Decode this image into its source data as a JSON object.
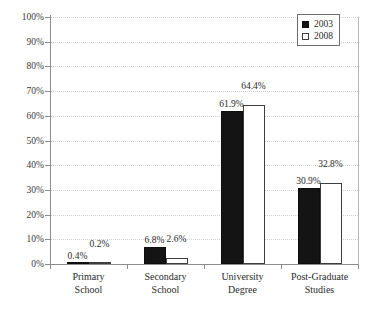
{
  "chart_data": {
    "type": "bar",
    "title": "",
    "subtitle": "",
    "xlabel": "",
    "ylabel": "",
    "ylim": [
      0,
      100
    ],
    "yticks": [
      "0%",
      "10%",
      "20%",
      "30%",
      "40%",
      "50%",
      "60%",
      "70%",
      "80%",
      "90%",
      "100%"
    ],
    "ytick_values": [
      0,
      10,
      20,
      30,
      40,
      50,
      60,
      70,
      80,
      90,
      100
    ],
    "grid": true,
    "legend_position": "top-right",
    "categories": [
      "Primary School",
      "Secondary School",
      "University Degree",
      "Post-Graduate Studies"
    ],
    "category_lines": [
      [
        "Primary",
        "School"
      ],
      [
        "Secondary",
        "School"
      ],
      [
        "University",
        "Degree"
      ],
      [
        "Post-Graduate",
        "Studies"
      ]
    ],
    "series": [
      {
        "name": "2003",
        "color": "#141414",
        "style": "filled",
        "values": [
          0.4,
          6.8,
          61.9,
          30.9
        ],
        "labels": [
          "0.4%",
          "6.8%",
          "61.9%",
          "30.9%"
        ]
      },
      {
        "name": "2008",
        "color": "#ffffff",
        "style": "hollow",
        "values": [
          0.2,
          2.6,
          64.4,
          32.8
        ],
        "labels": [
          "0.2%",
          "2.6%",
          "64.4%",
          "32.8%"
        ]
      }
    ]
  },
  "legend": {
    "items": [
      {
        "label": "2003",
        "style": "filled"
      },
      {
        "label": "2008",
        "style": "hollow"
      }
    ]
  },
  "colors": {
    "series_2003": "#141414",
    "series_2008": "#ffffff",
    "axis": "#8c8c8c",
    "grid": "#d2d2d2",
    "text": "#2b2b2b"
  }
}
